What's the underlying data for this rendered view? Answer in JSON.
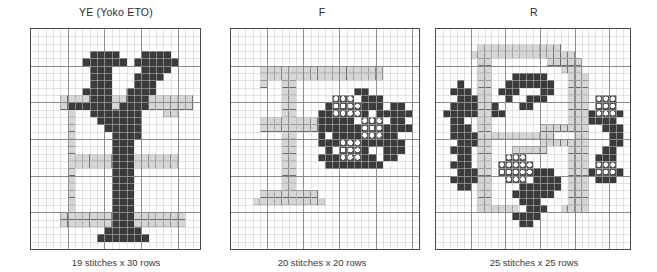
{
  "document": {
    "kind": "cross-stitch-pattern-sheet",
    "background_color": "#ffffff"
  },
  "palette": {
    "dark": "#3b3b3b",
    "light": "#d6d6d6",
    "blank": "#ffffff",
    "grid_minor": "#c9c9c9",
    "grid_major": "#8a8a8a",
    "border": "#4a4a4a",
    "symbol_circle_fill": "#ffffff",
    "symbol_circle_bg": "#555555",
    "text": "#2b2b2b"
  },
  "legend": {
    "dark_label": "dark",
    "light_label": "light",
    "circle_label": "circle-symbol",
    "blank_label": "blank"
  },
  "charts": [
    {
      "id": "chart-ye",
      "title": "YE (Yoko ETO)",
      "caption": "19 stitches x 30 rows",
      "stitches": 19,
      "rows": 30,
      "grid_cols": 23,
      "grid_rows": 30,
      "major_every": 5,
      "cells": [
        ".......................",
        ".......................",
        ".......................",
        "........DDDD...DDDD....",
        ".......DDDDDD.DDDDDD...",
        "........DDD....DDDD....",
        "........DDD...DDDD.....",
        "........DDD...DDD......",
        ".......DDDD..DDDD......",
        "....LLLLDDDLLDDDLLLLLL.",
        "....LDDDDDDLDDDDLLLLLL.",
        ".....L..DDDDDDD...LL...",
        ".....L...DDDDDD........",
        ".....L....DDDDD........",
        ".....L.....DDDD........",
        ".....L.....DDD.........",
        ".....L.....DDD.........",
        ".....LLLLLLDDDLLLLLL...",
        ".....LLLLLLDDDLLLLLL...",
        ".....L.....DDD.........",
        ".....L.....DDD.........",
        ".....L.....DDD.........",
        ".....L.....DDD.........",
        ".....L.....DDD.........",
        ".....L.....DDD.........",
        "....LLLLLLLDDDLLLLLLL..",
        "....LLLLLLLDDDLLLLLLL..",
        "..........DDDDD........",
        ".........DDDDDDD.......",
        ".......................",
        "......................."
      ]
    },
    {
      "id": "chart-f",
      "title": "F",
      "caption": "20 stitches x 20 rows",
      "stitches": 20,
      "rows": 20,
      "grid_cols": 26,
      "grid_rows": 30,
      "major_every": 5,
      "cells": [
        "..........................",
        "..........................",
        "..........................",
        "..........................",
        "..........................",
        "....LLLLLLLLLLLLLLLLL.....",
        "....LLLLLLLLLLLLLLLLL.....",
        "....L..LL.................",
        ".......LL........DD.......",
        ".......LL.....CCC.DDD.....",
        ".......LL....DCCCCDDD.DD..",
        ".......LL...DDCCCCD.DDDDD.",
        "....LLLLLLLLDDDDD.CCC.DD..",
        "....LLLLLLLLDDDDDDCCCDDDD.",
        ".......LL...D.DDDDCCCDD...",
        ".......LL...DDDCCCDDDDDD..",
        ".......LL....D.CCCD..DDD..",
        ".......LL...DDDCCCDD.DD...",
        ".......LL....DDDDDDDD.....",
        ".......LL.................",
        ".......LL.................",
        ".......LL.................",
        "....LLLLLLLL..............",
        "...LLLLLLLLLL.............",
        "..........................",
        "..........................",
        "..........................",
        "..........................",
        "..........................",
        ".........................."
      ]
    },
    {
      "id": "chart-r",
      "title": "R",
      "caption": "25 stitches x 25 rows",
      "stitches": 25,
      "rows": 25,
      "grid_cols": 28,
      "grid_rows": 30,
      "major_every": 5,
      "cells": [
        "............................",
        "............................",
        "......LLLLLLLLLLLL..........",
        ".....LLLLLLLLLLLLLLL........",
        "......LL........LLLLL.......",
        "......LL..........LLL.......",
        "......LL...DDDDD...LLL......",
        "...D..LL..DDDDDDD..LLL......",
        "..DDD.LL.DDD...DD..LLL......",
        "...DDDLL..D..DDD...LLL.CCC..",
        "..DDDDLLD...DD.....LLL.CCC..",
        ".DDDDDLLDD.........LLLDCCCD.",
        "..DD..LL...........LLLDDDD..",
        "..DDD.LL.......LLLLLLL..DDD.",
        "..DDDDLLLLLLLLLLL...LL...DD.",
        "...DDDLL.......LLLLLLL...DD.",
        "..DDD.LL...LLLLL...LLL..DD..",
        "...DD.LL..CCC......LLL.DDD..",
        "..DDD.LL.CCCCC.....LLL.CCC..",
        "...DDDLL.CCCCCDDD..LLLDCCCD.",
        "..DDDDLL..CCC.DDDD.LLL.DDD..",
        "...DD.LL....DDDDDD.LLL......",
        "......LL...DDDDDD..LLL......",
        "......LL....DDD....LLL......",
        "......LLLLLL.DDD..LLLL......",
        "...........DDDD.............",
        "............DD..............",
        "............................",
        "............................",
        "............................"
      ]
    }
  ],
  "layout": {
    "panels": [
      {
        "left": 14,
        "width": 204,
        "frame_left": 16,
        "frame_top": 28,
        "frame_width": 171,
        "frame_height": 222
      },
      {
        "left": 218,
        "width": 208,
        "frame_left": 12,
        "frame_top": 28,
        "frame_width": 190,
        "frame_height": 222
      },
      {
        "left": 426,
        "width": 216,
        "frame_left": 9,
        "frame_top": 28,
        "frame_width": 196,
        "frame_height": 222
      }
    ]
  }
}
